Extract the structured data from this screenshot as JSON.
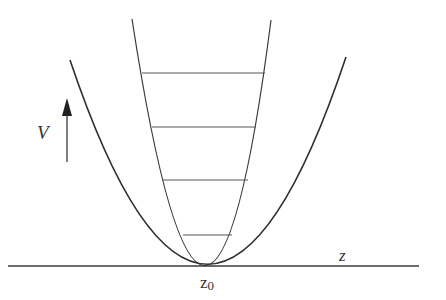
{
  "diagram": {
    "colors": {
      "background": "#ffffff",
      "stroke": "#3a3a3a",
      "level_stroke": "#555555"
    },
    "labels": {
      "vertical_axis": "V",
      "horizontal_axis": "z",
      "minimum_label": "z",
      "minimum_subscript": "0"
    },
    "baseline": {
      "x1": 8,
      "x2": 419,
      "y": 266
    },
    "vertex": {
      "x": 208,
      "y": 265
    },
    "narrow_well": {
      "left_top": [
        132,
        19
      ],
      "right_top": [
        271,
        20
      ]
    },
    "wide_well": {
      "left_top": [
        70,
        60
      ],
      "right_top": [
        346,
        57
      ]
    },
    "energy_levels": [
      {
        "y": 73,
        "x1": 142,
        "x2": 265
      },
      {
        "y": 127,
        "x1": 152,
        "x2": 256
      },
      {
        "y": 180,
        "x1": 163,
        "x2": 248
      },
      {
        "y": 235,
        "x1": 183,
        "x2": 232
      }
    ],
    "arrow": {
      "x": 67,
      "y_start": 162,
      "y_end": 98
    }
  }
}
